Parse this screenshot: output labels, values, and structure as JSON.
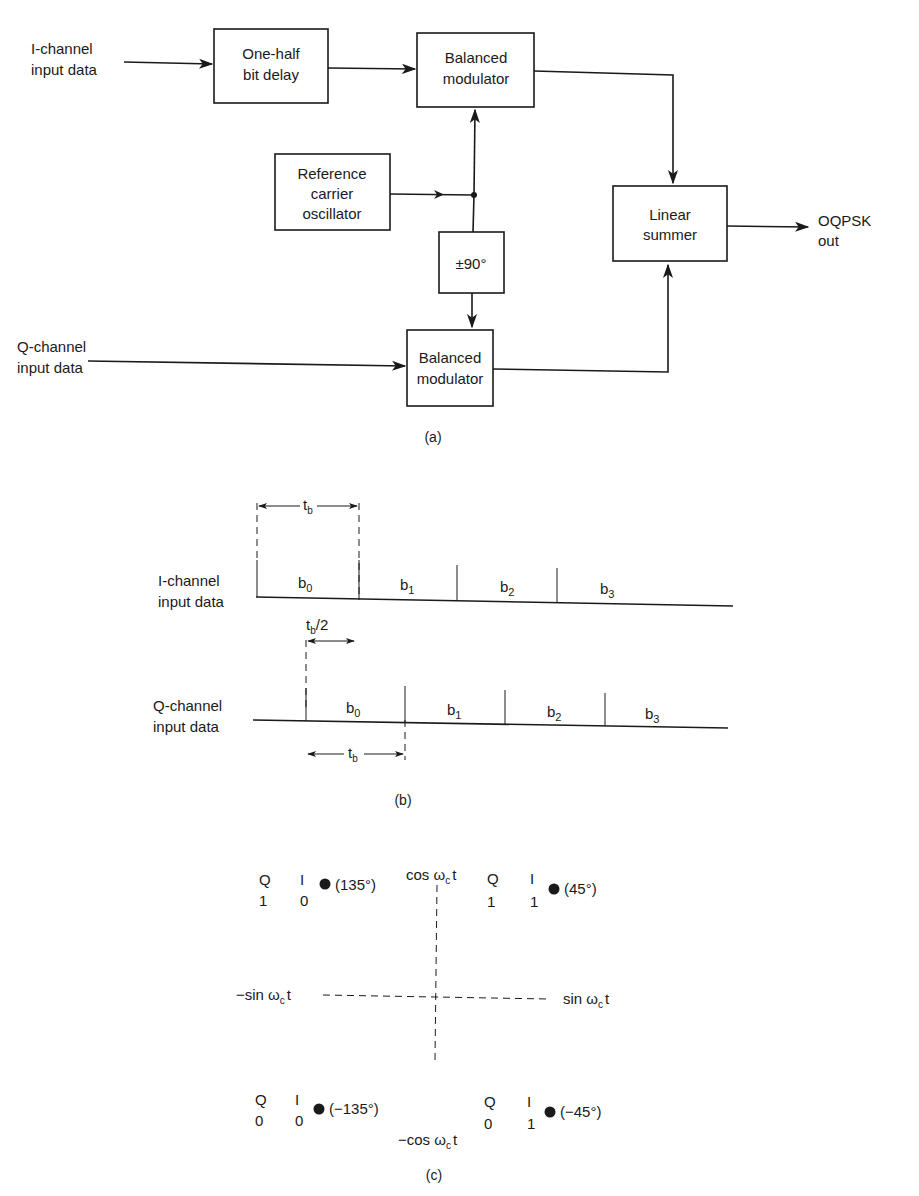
{
  "figure_a": {
    "caption": "(a)",
    "inputs": {
      "i_channel": [
        "I-channel",
        "input data"
      ],
      "q_channel": [
        "Q-channel",
        "input data"
      ]
    },
    "blocks": {
      "half_bit_delay": [
        "One-half",
        "bit delay"
      ],
      "balanced_modulator_top": [
        "Balanced",
        "modulator"
      ],
      "reference_oscillator": [
        "Reference",
        "carrier",
        "oscillator"
      ],
      "phase_shift": "±90°",
      "balanced_modulator_bottom": [
        "Balanced",
        "modulator"
      ],
      "linear_summer": [
        "Linear",
        "summer"
      ]
    },
    "output": [
      "OQPSK",
      "out"
    ]
  },
  "figure_b": {
    "caption": "(b)",
    "i_channel_label": [
      "I-channel",
      "input data"
    ],
    "q_channel_label": [
      "Q-channel",
      "input data"
    ],
    "bits": [
      "b",
      "b",
      "b",
      "b"
    ],
    "bit_subscripts": [
      "0",
      "1",
      "2",
      "3"
    ],
    "dim_tb": "t",
    "dim_tb_sub": "b",
    "dim_half_tb_suffix": "/2"
  },
  "figure_c": {
    "caption": "(c)",
    "axes": {
      "top": "cos ω",
      "bottom": "−cos ω",
      "left": "−sin ω",
      "right": "sin ω",
      "sub": "c",
      "suffix": "t"
    },
    "points": [
      {
        "q": "1",
        "i": "0",
        "phase": "(135°)"
      },
      {
        "q": "1",
        "i": "1",
        "phase": "(45°)"
      },
      {
        "q": "0",
        "i": "0",
        "phase": "(−135°)"
      },
      {
        "q": "0",
        "i": "1",
        "phase": "(−45°)"
      }
    ],
    "header_q": "Q",
    "header_i": "I"
  }
}
